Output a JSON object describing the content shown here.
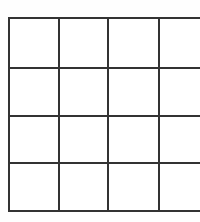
{
  "figure": {
    "kind": "grid-table",
    "background_color": "#fefefe",
    "line_color": "#333333",
    "cell_fill_color": "#ffffff",
    "line_width_px": 2,
    "rows": 4,
    "columns": 4,
    "total_cells": 16
  },
  "geometry": {
    "canvas_width": 200,
    "canvas_height": 222,
    "grid_left": 8,
    "grid_top": 17,
    "grid_width": 185,
    "grid_height": 193,
    "column_widths": [
      48,
      47,
      49,
      41
    ],
    "row_heights": [
      50,
      48,
      47,
      48
    ],
    "vertical_line_x": [
      8,
      56,
      103,
      152,
      193
    ],
    "horizontal_line_y": [
      17,
      67,
      115,
      162,
      210
    ]
  },
  "chart_data": {
    "type": "table",
    "title": "",
    "xlabel": "",
    "ylabel": "",
    "grid": true,
    "legend": "none",
    "columns": [
      "",
      "",
      "",
      ""
    ],
    "rows": [
      [
        "",
        "",
        "",
        ""
      ],
      [
        "",
        "",
        "",
        ""
      ],
      [
        "",
        "",
        "",
        ""
      ],
      [
        "",
        "",
        "",
        ""
      ]
    ]
  }
}
